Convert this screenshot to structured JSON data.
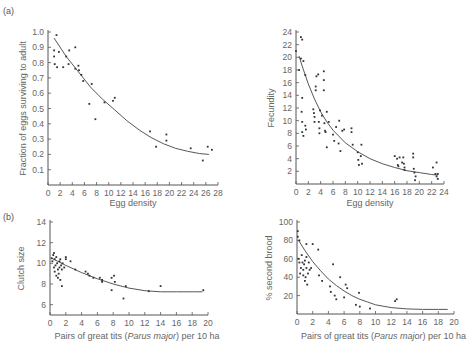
{
  "panels": {
    "a": "(a)",
    "b": "(b)"
  },
  "chart_data": [
    {
      "type": "scatter",
      "panel": "(a)",
      "xlabel": "Egg density",
      "ylabel": "Fraction of eggs surviving to adult",
      "xlim": [
        0,
        28
      ],
      "ylim": [
        0,
        1.0
      ],
      "xticks": [
        0,
        2,
        4,
        6,
        8,
        10,
        12,
        14,
        16,
        18,
        20,
        22,
        24,
        26,
        28
      ],
      "yticks": [
        0.1,
        0.2,
        0.3,
        0.4,
        0.5,
        0.6,
        0.7,
        0.8,
        0.9,
        1.0
      ],
      "grid": false,
      "points": [
        [
          1,
          0.88
        ],
        [
          1,
          0.84
        ],
        [
          1.1,
          0.79
        ],
        [
          1.4,
          0.98
        ],
        [
          1.5,
          0.77
        ],
        [
          1.8,
          0.87
        ],
        [
          2.5,
          0.77
        ],
        [
          3,
          0.84
        ],
        [
          3.4,
          0.79
        ],
        [
          3.5,
          0.88
        ],
        [
          4.5,
          0.9
        ],
        [
          4.5,
          0.76
        ],
        [
          5,
          0.78
        ],
        [
          5.1,
          0.75
        ],
        [
          5.5,
          0.72
        ],
        [
          5.8,
          0.68
        ],
        [
          6.8,
          0.53
        ],
        [
          7.2,
          0.66
        ],
        [
          7.8,
          0.43
        ],
        [
          9.3,
          0.54
        ],
        [
          10.7,
          0.55
        ],
        [
          11,
          0.57
        ],
        [
          16.8,
          0.35
        ],
        [
          17.8,
          0.25
        ],
        [
          19.5,
          0.33
        ],
        [
          19.5,
          0.29
        ],
        [
          23.5,
          0.24
        ],
        [
          25.5,
          0.16
        ],
        [
          26.3,
          0.25
        ],
        [
          27,
          0.23
        ]
      ],
      "fit_curve": [
        [
          1,
          0.96
        ],
        [
          3,
          0.84
        ],
        [
          5,
          0.74
        ],
        [
          7,
          0.64
        ],
        [
          9,
          0.56
        ],
        [
          11,
          0.49
        ],
        [
          13,
          0.42
        ],
        [
          15,
          0.36
        ],
        [
          17,
          0.31
        ],
        [
          19,
          0.27
        ],
        [
          21,
          0.24
        ],
        [
          23,
          0.22
        ],
        [
          25,
          0.205
        ],
        [
          26.5,
          0.2
        ]
      ]
    },
    {
      "type": "scatter",
      "panel": "(a)",
      "xlabel": "Egg density",
      "ylabel": "Fecundity",
      "xlim": [
        0,
        24
      ],
      "ylim": [
        0,
        24
      ],
      "xticks": [
        0,
        2,
        4,
        6,
        8,
        10,
        12,
        14,
        16,
        18,
        20,
        22,
        24
      ],
      "yticks": [
        2,
        4,
        6,
        8,
        10,
        12,
        14,
        16,
        18,
        20,
        22,
        24
      ],
      "grid": false,
      "points": [
        [
          0,
          21
        ],
        [
          0.5,
          18
        ],
        [
          0.8,
          23.2
        ],
        [
          1,
          22.8
        ],
        [
          0.8,
          19.8
        ],
        [
          1.2,
          19.4
        ],
        [
          1.5,
          17.2
        ],
        [
          1,
          13.6
        ],
        [
          0.9,
          11.4
        ],
        [
          1,
          9.8
        ],
        [
          1,
          8.2
        ],
        [
          1.2,
          7.6
        ],
        [
          1.5,
          9.2
        ],
        [
          1.6,
          8.6
        ],
        [
          2.8,
          11.8
        ],
        [
          2.9,
          11.2
        ],
        [
          3,
          10.6
        ],
        [
          3,
          9.8
        ],
        [
          3.2,
          15.4
        ],
        [
          3.2,
          14.8
        ],
        [
          3.3,
          17
        ],
        [
          3.6,
          17.3
        ],
        [
          3.7,
          9.8
        ],
        [
          3.8,
          8
        ],
        [
          3.8,
          8.8
        ],
        [
          3.9,
          11.6
        ],
        [
          4.2,
          10.8
        ],
        [
          4.5,
          17.8
        ],
        [
          4.5,
          16.4
        ],
        [
          4.5,
          14.8
        ],
        [
          4.6,
          9.6
        ],
        [
          4.7,
          8.4
        ],
        [
          4.8,
          8.2
        ],
        [
          5,
          11.4
        ],
        [
          5,
          5.8
        ],
        [
          5.3,
          9.8
        ],
        [
          6,
          7.8
        ],
        [
          6.2,
          6.8
        ],
        [
          6.5,
          9
        ],
        [
          6.9,
          6.4
        ],
        [
          7,
          10
        ],
        [
          7.2,
          5.2
        ],
        [
          7.5,
          8.4
        ],
        [
          7.8,
          8.6
        ],
        [
          9,
          8.8
        ],
        [
          9,
          8.2
        ],
        [
          9.2,
          6.2
        ],
        [
          10,
          5
        ],
        [
          10.1,
          3.8
        ],
        [
          10.2,
          3
        ],
        [
          10.5,
          4.4
        ],
        [
          10.6,
          6.2
        ],
        [
          10.7,
          3.2
        ],
        [
          16,
          4.4
        ],
        [
          16.4,
          4
        ],
        [
          16.5,
          3
        ],
        [
          16.6,
          2.8
        ],
        [
          16.8,
          4.2
        ],
        [
          17.2,
          3.4
        ],
        [
          17.4,
          4.2
        ],
        [
          17.5,
          3.2
        ],
        [
          17.6,
          2.2
        ],
        [
          17.6,
          2.6
        ],
        [
          19,
          4.8
        ],
        [
          19,
          4.2
        ],
        [
          19.1,
          2.4
        ],
        [
          19.2,
          1.8
        ],
        [
          19.4,
          1.2
        ],
        [
          19.3,
          0.6
        ],
        [
          22.2,
          2.6
        ],
        [
          22.6,
          1.6
        ],
        [
          22.8,
          3.4
        ],
        [
          22.8,
          1.2
        ],
        [
          23,
          0.8
        ],
        [
          23,
          1.6
        ]
      ],
      "fit_curve": [
        [
          0.5,
          20.2
        ],
        [
          1,
          18.6
        ],
        [
          2,
          15.8
        ],
        [
          3,
          13.4
        ],
        [
          4,
          11.4
        ],
        [
          5,
          9.8
        ],
        [
          6,
          8.5
        ],
        [
          8,
          6.5
        ],
        [
          10,
          5.1
        ],
        [
          12,
          4
        ],
        [
          14,
          3.2
        ],
        [
          16,
          2.6
        ],
        [
          18,
          2.1
        ],
        [
          20,
          1.8
        ],
        [
          22,
          1.5
        ],
        [
          23,
          1.4
        ]
      ]
    },
    {
      "type": "scatter",
      "panel": "(b)",
      "xlabel": "Pairs of great tits (Parus major) per 10 ha",
      "ylabel": "Clutch size",
      "xlim": [
        0,
        20
      ],
      "ylim": [
        5,
        15
      ],
      "xticks": [
        0,
        2,
        4,
        6,
        8,
        10,
        12,
        14,
        16,
        18,
        20
      ],
      "yticks": [
        6,
        8,
        10,
        12,
        14
      ],
      "grid": false,
      "points": [
        [
          0.2,
          10.5
        ],
        [
          0.3,
          10.2
        ],
        [
          0.4,
          10.8
        ],
        [
          0.5,
          9.6
        ],
        [
          0.5,
          11
        ],
        [
          0.6,
          10.4
        ],
        [
          0.6,
          9.2
        ],
        [
          0.7,
          9.8
        ],
        [
          0.8,
          10.6
        ],
        [
          0.8,
          8.8
        ],
        [
          0.9,
          10
        ],
        [
          1,
          9.4
        ],
        [
          1,
          8.6
        ],
        [
          1.1,
          9
        ],
        [
          1.2,
          10.2
        ],
        [
          1.2,
          9.6
        ],
        [
          1.3,
          8.4
        ],
        [
          1.3,
          10.4
        ],
        [
          1.4,
          9.8
        ],
        [
          1.5,
          7.8
        ],
        [
          1.5,
          9.4
        ],
        [
          1.6,
          10
        ],
        [
          1.8,
          9.6
        ],
        [
          2,
          10.4
        ],
        [
          2,
          10.6
        ],
        [
          2.6,
          10.2
        ],
        [
          3.2,
          9.4
        ],
        [
          4.5,
          9.2
        ],
        [
          4.8,
          9
        ],
        [
          5,
          8.8
        ],
        [
          5.5,
          8.6
        ],
        [
          6.3,
          8.6
        ],
        [
          6.6,
          8.4
        ],
        [
          6.6,
          8.2
        ],
        [
          7.8,
          8.6
        ],
        [
          7.8,
          7.4
        ],
        [
          8.1,
          8.8
        ],
        [
          8.2,
          8.2
        ],
        [
          9.3,
          6.6
        ],
        [
          9.6,
          7.8
        ],
        [
          12.5,
          7.3
        ],
        [
          14,
          7.8
        ],
        [
          19.4,
          7.4
        ]
      ],
      "fit_curve": [
        [
          0.2,
          10.5
        ],
        [
          2,
          9.8
        ],
        [
          4,
          9.1
        ],
        [
          6,
          8.5
        ],
        [
          8,
          8
        ],
        [
          10,
          7.6
        ],
        [
          12,
          7.35
        ],
        [
          14,
          7.25
        ],
        [
          16,
          7.25
        ],
        [
          18,
          7.25
        ],
        [
          19.3,
          7.25
        ]
      ]
    },
    {
      "type": "scatter",
      "panel": "(b)",
      "xlabel": "Pairs of great tits (Parus major) per 10 ha",
      "ylabel": "% second brood",
      "xlim": [
        0,
        20
      ],
      "ylim": [
        0,
        100
      ],
      "xticks": [
        0,
        2,
        4,
        6,
        8,
        10,
        12,
        14,
        16,
        18,
        20
      ],
      "yticks": [
        20,
        40,
        60,
        80,
        100
      ],
      "grid": false,
      "points": [
        [
          0.1,
          90
        ],
        [
          0.1,
          84
        ],
        [
          0.3,
          80
        ],
        [
          0.2,
          60
        ],
        [
          0.3,
          56
        ],
        [
          0.4,
          44
        ],
        [
          0.5,
          50
        ],
        [
          0.6,
          64
        ],
        [
          0.7,
          56
        ],
        [
          0.8,
          48
        ],
        [
          0.8,
          42
        ],
        [
          0.9,
          54
        ],
        [
          1,
          58
        ],
        [
          1,
          36
        ],
        [
          1.1,
          40
        ],
        [
          1.2,
          76
        ],
        [
          1.2,
          62
        ],
        [
          1.2,
          50
        ],
        [
          1.3,
          32
        ],
        [
          1.4,
          44
        ],
        [
          1.5,
          56
        ],
        [
          1.6,
          48
        ],
        [
          1.8,
          50
        ],
        [
          2,
          76
        ],
        [
          2.7,
          70
        ],
        [
          2.8,
          42
        ],
        [
          3.2,
          36
        ],
        [
          4.2,
          30
        ],
        [
          4.3,
          24
        ],
        [
          4.6,
          54
        ],
        [
          4.8,
          20
        ],
        [
          5,
          16
        ],
        [
          5.5,
          40
        ],
        [
          6,
          18
        ],
        [
          6.2,
          32
        ],
        [
          6.4,
          28
        ],
        [
          7.5,
          10
        ],
        [
          7.9,
          23
        ],
        [
          8,
          8
        ],
        [
          9.3,
          6
        ],
        [
          12.5,
          14
        ],
        [
          12.7,
          16
        ]
      ],
      "fit_curve": [
        [
          0.2,
          80
        ],
        [
          1,
          69
        ],
        [
          2,
          57
        ],
        [
          3,
          47
        ],
        [
          4,
          38
        ],
        [
          5,
          31
        ],
        [
          6,
          25
        ],
        [
          7,
          20
        ],
        [
          8,
          16
        ],
        [
          9,
          13
        ],
        [
          10,
          10
        ],
        [
          12,
          7
        ],
        [
          14,
          5.5
        ],
        [
          16,
          5
        ],
        [
          18,
          5
        ],
        [
          19.2,
          5
        ]
      ]
    }
  ]
}
